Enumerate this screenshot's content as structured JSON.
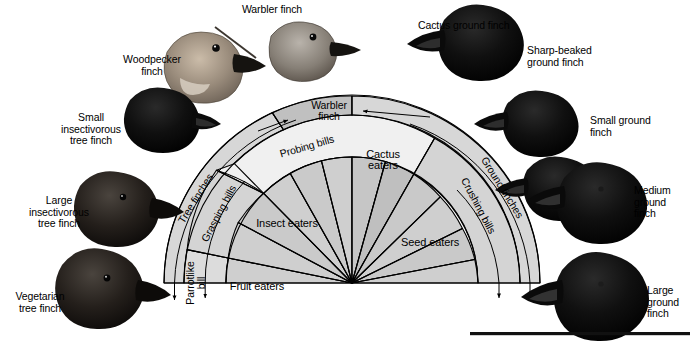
{
  "figure": {
    "kind": "galapagos-finch-adaptive-radiation-fan-diagram",
    "center_x": 352,
    "center_y": 283
  },
  "rings": {
    "outer": {
      "name": "group-ring",
      "labels": [
        {
          "id": "tree-finches",
          "text": "Tree finches"
        },
        {
          "id": "warbler-finch-box",
          "text": "Warbler\nfinch"
        },
        {
          "id": "ground-finches",
          "text": "Ground finches"
        }
      ]
    },
    "middle": {
      "name": "bill-type-ring",
      "labels": [
        {
          "id": "parrotlike-bill",
          "text": "Parrotlike\nbill"
        },
        {
          "id": "grasping-bills",
          "text": "Grasping bills"
        },
        {
          "id": "probing-bills",
          "text": "Probing bills"
        },
        {
          "id": "crushing-bills",
          "text": "Crushing bills"
        }
      ]
    },
    "inner": {
      "name": "diet-ring",
      "labels": [
        {
          "id": "fruit-eaters",
          "text": "Fruit eaters"
        },
        {
          "id": "insect-eaters",
          "text": "Insect eaters"
        },
        {
          "id": "cactus-eaters",
          "text": "Cactus\neaters"
        },
        {
          "id": "seed-eaters",
          "text": "Seed eaters"
        }
      ]
    }
  },
  "species": [
    {
      "id": "warbler-finch",
      "text": "Warbler finch"
    },
    {
      "id": "woodpecker-finch",
      "text": "Woodpecker\nfinch"
    },
    {
      "id": "small-insectivorous-tree-finch",
      "text": "Small\ninsectivorous\ntree finch"
    },
    {
      "id": "large-insectivorous-tree-finch",
      "text": "Large\ninsectivorous\ntree finch"
    },
    {
      "id": "vegetarian-tree-finch",
      "text": "Vegetarian\ntree finch"
    },
    {
      "id": "cactus-ground-finch",
      "text": "Cactus ground finch"
    },
    {
      "id": "sharp-beaked-ground-finch",
      "text": "Sharp-beaked\nground finch"
    },
    {
      "id": "small-ground-finch",
      "text": "Small ground\nfinch"
    },
    {
      "id": "medium-ground-finch",
      "text": "Medium\nground\nfinch"
    },
    {
      "id": "large-ground-finch",
      "text": "Large\nground\nfinch"
    }
  ],
  "colors": {
    "page_background": "#ffffff",
    "ring_fill_light": "#f2f2f2",
    "ring_fill_mid": "#d9d9d9",
    "ring_fill_dark": "#c2c2c2",
    "wedge_fill": "#d2d2d2",
    "wedge_fill_alt": "#c8c8c8",
    "stroke": "#000000",
    "bird_dark": "#141414",
    "bird_brown": "#8f8175",
    "bottom_bar": "#111111"
  }
}
